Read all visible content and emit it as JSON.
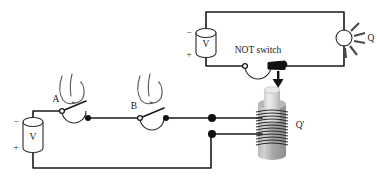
{
  "figure": {
    "type": "circuit-diagram"
  },
  "top_circuit": {
    "battery": {
      "label": "V",
      "minus": "−",
      "plus": "+"
    },
    "switch": {
      "label": "NOT switch",
      "state": "closed"
    },
    "lamp": {
      "label": "Q"
    }
  },
  "bottom_circuit": {
    "battery": {
      "label": "V",
      "minus": "−",
      "plus": "+"
    },
    "switch_a": {
      "label": "A",
      "state": "open"
    },
    "switch_b": {
      "label": "B",
      "state": "open"
    },
    "solenoid": {
      "label": "Q'"
    }
  },
  "colors": {
    "wire": "#1a1a1a",
    "outline": "#2b2b2b",
    "node": "#111111",
    "ray": "#4a4a4a",
    "background": "#ffffff",
    "solenoid_body": "#a8a8a8",
    "plunger": "#d8d8d8"
  }
}
